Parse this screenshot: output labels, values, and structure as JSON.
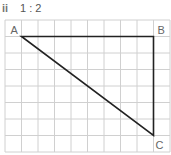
{
  "heading": {
    "number": "ii",
    "ratio": "1 : 2"
  },
  "grid": {
    "columns": 10,
    "rows": 8,
    "origin_x": 5,
    "origin_y": 20,
    "cell_size": 16.5,
    "line_color": "#d0d0d0"
  },
  "triangle": {
    "stroke_color": "#222222",
    "vertices": [
      {
        "label": "A",
        "col": 1,
        "row": 1
      },
      {
        "label": "B",
        "col": 9,
        "row": 1
      },
      {
        "label": "C",
        "col": 9,
        "row": 7
      }
    ]
  }
}
